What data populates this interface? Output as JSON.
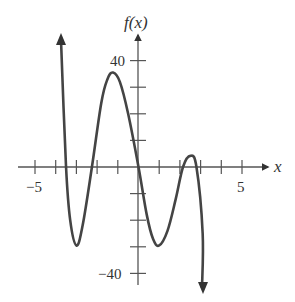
{
  "chart_data": {
    "type": "line",
    "title": "",
    "xlabel": "x",
    "ylabel": "f(x)",
    "xlim": [
      -5.0,
      6.0
    ],
    "ylim": [
      -45,
      48
    ],
    "x_ticks": [
      -5,
      -4,
      -3,
      -2,
      -1,
      1,
      2,
      3,
      4,
      5
    ],
    "x_tick_labels": [
      {
        "value": -5,
        "label": "−5"
      },
      {
        "value": 5,
        "label": "5"
      }
    ],
    "y_ticks": [
      -40,
      -30,
      -20,
      -10,
      10,
      20,
      30,
      40
    ],
    "y_tick_labels": [
      {
        "value": 40,
        "label": "40"
      },
      {
        "value": -40,
        "label": "−40"
      }
    ],
    "grid": false,
    "legend": null,
    "series": [
      {
        "name": "f(x)",
        "description": "Quintic-like polynomial with negative leading coefficient; arrows at both ends",
        "points": [
          [
            -3.7,
            48
          ],
          [
            -3.5,
            0
          ],
          [
            -3.3,
            -20
          ],
          [
            -3.0,
            -29.5
          ],
          [
            -2.7,
            -22
          ],
          [
            -2.25,
            0
          ],
          [
            -1.8,
            24
          ],
          [
            -1.5,
            33
          ],
          [
            -1.23,
            35.5
          ],
          [
            -0.9,
            32
          ],
          [
            -0.5,
            20
          ],
          [
            0,
            0
          ],
          [
            0.4,
            -18
          ],
          [
            0.7,
            -27
          ],
          [
            1.0,
            -29.5
          ],
          [
            1.4,
            -24
          ],
          [
            1.8,
            -12
          ],
          [
            2.15,
            0
          ],
          [
            2.5,
            4.2
          ],
          [
            2.8,
            0
          ],
          [
            3.1,
            -25
          ],
          [
            3.1,
            -46
          ]
        ],
        "key_points": {
          "local_max": [
            [
              -1.23,
              35.5
            ],
            [
              2.5,
              4.2
            ]
          ],
          "local_min": [
            [
              -3.0,
              -29.5
            ],
            [
              1.0,
              -29.5
            ]
          ],
          "zeros": [
            -3.5,
            -2.25,
            0,
            2.15,
            2.8
          ]
        }
      }
    ]
  },
  "axes": {
    "x_label": "x",
    "y_label": "f(x)",
    "x_neg_label": "−5",
    "x_pos_label": "5",
    "y_pos_label": "40",
    "y_neg_label": "−40"
  }
}
